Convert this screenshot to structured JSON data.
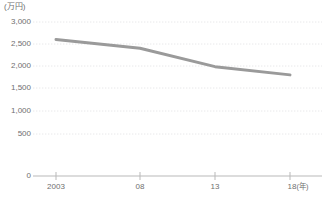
{
  "chart_data": {
    "type": "line",
    "title": "",
    "xlabel": "(年)",
    "ylabel": "(万円)",
    "y_unit_label": "(万円)",
    "x_unit_label": "(年)",
    "categories": [
      "2003",
      "08",
      "13",
      "18"
    ],
    "x_tick_labels": [
      "2003",
      "08",
      "13",
      "18"
    ],
    "x_values": [
      2003,
      2008,
      2013,
      2018
    ],
    "values": [
      2660,
      2490,
      2130,
      1970
    ],
    "series": [
      {
        "name": "",
        "values": [
          2660,
          2490,
          2130,
          1970
        ],
        "color": "#9a9a9a"
      }
    ],
    "y_tick_labels": [
      "3,000",
      "2,500",
      "2,000",
      "1,500",
      "1,000",
      "500",
      "0"
    ],
    "y_ticks": [
      3000,
      2500,
      2000,
      1500,
      1000,
      500,
      0
    ],
    "ylim": [
      0,
      3000
    ],
    "xlim": [
      2003,
      2018
    ],
    "grid": true,
    "grid_style": "dotted",
    "grid_color": "#e8e8ea",
    "legend": false,
    "legend_position": "none",
    "axis_color": "#b9b9b9",
    "text_color": "#6f6f6f"
  }
}
